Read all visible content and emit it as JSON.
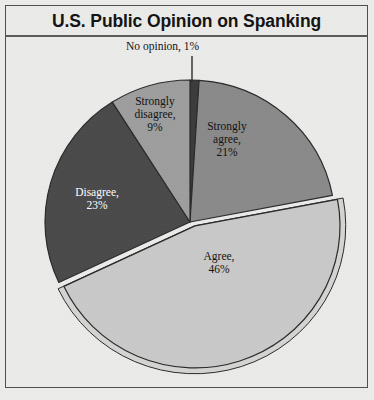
{
  "title": "U.S. Public Opinion on Spanking",
  "chart_data": {
    "type": "pie",
    "title": "U.S. Public Opinion on Spanking",
    "xlabel": "",
    "ylabel": "",
    "legend_position": "none",
    "grid": false,
    "start_angle_deg": 0,
    "direction": "clockwise",
    "categories": [
      "No opinion",
      "Strongly agree",
      "Agree",
      "Disagree",
      "Strongly disagree"
    ],
    "values": [
      1,
      21,
      46,
      23,
      9
    ],
    "unit": "%",
    "labels": [
      "No opinion, 1%",
      "Strongly\nagree,\n21%",
      "Agree,\n46%",
      "Disagree,\n23%",
      "Strongly\ndisagree,\n9%"
    ],
    "slices": [
      {
        "name": "No opinion",
        "value": 1,
        "label": "No opinion, 1%",
        "color": "#3c3c3c",
        "label_color": "#111111",
        "label_placement": "callout",
        "exploded": false
      },
      {
        "name": "Strongly agree",
        "value": 21,
        "label": "Strongly\nagree,\n21%",
        "color": "#8a8a8a",
        "label_color": "#111111",
        "label_placement": "inside",
        "exploded": false
      },
      {
        "name": "Agree",
        "value": 46,
        "label": "Agree,\n46%",
        "color": "#c9c9c9",
        "label_color": "#111111",
        "label_placement": "inside",
        "exploded": true
      },
      {
        "name": "Disagree",
        "value": 23,
        "label": "Disagree,\n23%",
        "color": "#4a4a4a",
        "label_color": "#ffffff",
        "label_placement": "inside",
        "exploded": false
      },
      {
        "name": "Strongly disagree",
        "value": 9,
        "label": "Strongly\ndisagree,\n9%",
        "color": "#9e9e9e",
        "label_color": "#111111",
        "label_placement": "inside",
        "exploded": false
      }
    ],
    "total": 100
  },
  "colors": {
    "background": "#ebebea",
    "frame_border": "#4e4e4e",
    "title_text": "#131313",
    "slice_outline": "#2b2b2b"
  }
}
